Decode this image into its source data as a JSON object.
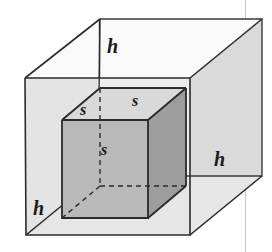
{
  "figure": {
    "background_color": "#ffffff"
  },
  "labels": {
    "height_top": "h",
    "height_left": "h",
    "height_right": "h",
    "side_top_left": "s",
    "side_top_right": "s",
    "side_front": "s"
  },
  "colors": {
    "line": "#2b2b2b",
    "line_light": "#555555",
    "scan_line": "#c9c9c9",
    "outer_left_face": "#e3e3e3",
    "outer_right_face": "#dcdcdc",
    "outer_bottom_face": "#e8e8e8",
    "outer_front_face": "#f2f2f2",
    "cube_front_face": "#b9b9b9",
    "cube_right_face": "#9d9d9d",
    "cube_top_face": "#d8d8d8",
    "label_color": "#1a1a1a"
  },
  "geometry": {
    "projection": "oblique",
    "outer_box": {
      "front_top_left": [
        25,
        78
      ],
      "front_top_right": [
        190,
        78
      ],
      "front_bottom_right": [
        190,
        235
      ],
      "front_bottom_left": [
        26,
        235
      ],
      "back_top_left": [
        100,
        19
      ],
      "back_top_right": [
        262,
        19
      ],
      "back_bottom_right": [
        262,
        176
      ],
      "back_bottom_left": [
        98,
        176
      ],
      "depth_offset": [
        73,
        -59
      ]
    },
    "inner_cube": {
      "front_top_left": [
        62,
        120
      ],
      "front_top_right": [
        148,
        120
      ],
      "front_bottom_right": [
        148,
        218
      ],
      "front_bottom_left": [
        62,
        218
      ],
      "back_top_left": [
        100,
        88
      ],
      "back_top_right": [
        186,
        88
      ],
      "back_bottom_right": [
        186,
        186
      ],
      "back_bottom_left": [
        100,
        186
      ],
      "depth_offset": [
        38,
        -32
      ],
      "edge_length_label": "s"
    },
    "hidden_edges": [
      "cube back-bottom-left vertical",
      "cube back-bottom-left to front-bottom-left",
      "cube back-bottom-left to back-bottom-right"
    ]
  },
  "label_positions": {
    "height_top": [
      100,
      53
    ],
    "height_left": [
      33,
      215
    ],
    "height_right": [
      214,
      165
    ],
    "side_top_left": [
      84,
      115
    ],
    "side_top_right": [
      135,
      107
    ],
    "side_front": [
      104,
      155
    ]
  }
}
